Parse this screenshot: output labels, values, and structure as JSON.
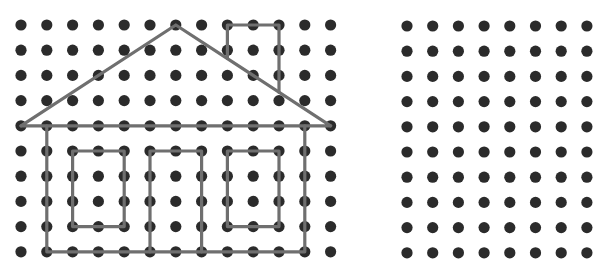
{
  "colors": {
    "background": "#ffffff",
    "dot": "#2b2b2b",
    "line": "#6f6f6f",
    "line_highlight": "#9a9a9a"
  },
  "left_grid": {
    "cols": 13,
    "rows": 10,
    "origin_x": 21,
    "origin_y": 25,
    "spacing_x": 25.8,
    "spacing_y": 25.2,
    "dot_radius": 5.6
  },
  "right_grid": {
    "cols": 8,
    "rows": 10,
    "origin_x": 407,
    "origin_y": 26,
    "spacing_x": 25.7,
    "spacing_y": 25.2,
    "dot_radius": 5.6
  },
  "house": {
    "description": "House outline drawn with lines on the left dot grid (grid coordinates col,row)",
    "shapes": [
      {
        "name": "roof",
        "type": "polyline",
        "points": [
          [
            0,
            4
          ],
          [
            6,
            0
          ],
          [
            12,
            4
          ]
        ]
      },
      {
        "name": "roof-base",
        "type": "polyline",
        "points": [
          [
            0,
            4
          ],
          [
            12,
            4
          ]
        ]
      },
      {
        "name": "chimney",
        "type": "polyline",
        "points": [
          [
            8,
            1.33
          ],
          [
            8,
            0
          ],
          [
            10,
            0
          ],
          [
            10,
            2.67
          ]
        ]
      },
      {
        "name": "house-body",
        "type": "polyline",
        "points": [
          [
            1,
            4
          ],
          [
            1,
            9
          ],
          [
            11,
            9
          ],
          [
            11,
            4
          ]
        ]
      },
      {
        "name": "left-window",
        "type": "rect",
        "points": [
          [
            2,
            5
          ],
          [
            4,
            8
          ]
        ]
      },
      {
        "name": "door",
        "type": "polyline",
        "points": [
          [
            5,
            9
          ],
          [
            5,
            5
          ],
          [
            7,
            5
          ],
          [
            7,
            9
          ]
        ]
      },
      {
        "name": "right-window",
        "type": "rect",
        "points": [
          [
            8,
            5
          ],
          [
            10,
            8
          ]
        ]
      }
    ]
  }
}
